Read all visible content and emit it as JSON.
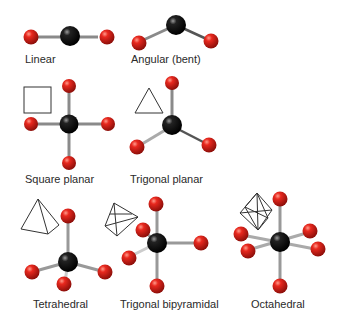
{
  "colors": {
    "central_atom": "#111111",
    "ligand_atom": "#d8231c",
    "bond": "#8a8a8a",
    "outline": "#333333"
  },
  "geometries": [
    {
      "id": "linear",
      "label": "Linear"
    },
    {
      "id": "angular",
      "label": "Angular (bent)"
    },
    {
      "id": "square-planar",
      "label": "Square planar"
    },
    {
      "id": "trigonal-planar",
      "label": "Trigonal planar"
    },
    {
      "id": "tetrahedral",
      "label": "Tetrahedral"
    },
    {
      "id": "trigonal-bipyramidal",
      "label": "Trigonal bipyramidal"
    },
    {
      "id": "octahedral",
      "label": "Octahedral"
    }
  ]
}
